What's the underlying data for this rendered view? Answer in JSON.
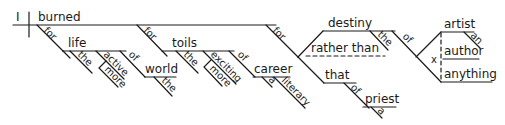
{
  "diagram": {
    "type": "Reed-Kellogg sentence diagram",
    "subject": "I",
    "verb": "burned",
    "phrases": {
      "life_phrase": {
        "preposition": "for",
        "object": "life",
        "modifiers": [
          "the",
          "active",
          "more"
        ],
        "sub_prep": "of",
        "sub_object": "world",
        "sub_modifier": "the"
      },
      "toils_phrase": {
        "preposition": "for",
        "object": "toils",
        "modifiers": [
          "the",
          "exciting",
          "more"
        ],
        "sub_prep": "of",
        "sub_object": "career",
        "sub_modifiers": [
          "a",
          "literary"
        ]
      },
      "destiny_phrase": {
        "preposition": "for",
        "object_1": "destiny",
        "object_1_modifier": "the",
        "conjunction": "rather than",
        "object_2": "that",
        "object_2_prep": "of",
        "object_2_sub_object": "priest",
        "object_2_sub_modifier": "a",
        "destiny_prep": "of",
        "compound_objects": [
          "artist",
          "author",
          "anything"
        ],
        "artist_modifier": "an",
        "compound_marker": "x"
      }
    }
  }
}
